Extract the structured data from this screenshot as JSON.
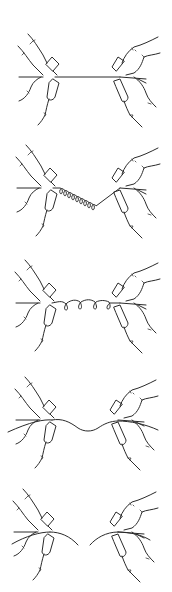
{
  "figure": {
    "stroke_color": "#2a2a2a",
    "background": "#ffffff",
    "panels": [
      {
        "index": 1,
        "name": "taut-straight-string",
        "center_y": 77,
        "string": "straight"
      },
      {
        "index": 2,
        "name": "tight-coiled-spring",
        "center_y": 188,
        "string": "coil",
        "coils": 9
      },
      {
        "index": 3,
        "name": "loose-coiled-spring",
        "center_y": 303,
        "string": "loose-coil",
        "coils": 4
      },
      {
        "index": 4,
        "name": "slack-wavy-string",
        "center_y": 420,
        "string": "sag"
      },
      {
        "index": 5,
        "name": "broken-string",
        "center_y": 532,
        "string": "broken"
      }
    ]
  }
}
